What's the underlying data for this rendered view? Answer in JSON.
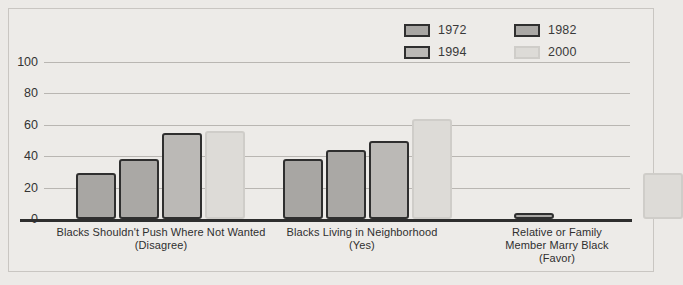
{
  "chart_data": {
    "type": "bar",
    "title": "",
    "subtitle": "",
    "xlabel": "",
    "ylabel": "",
    "ylim": [
      0,
      100
    ],
    "yticks": [
      0,
      20,
      40,
      60,
      80,
      100
    ],
    "ytick_labels": [
      "0",
      "20",
      "40",
      "60",
      "80",
      "100"
    ],
    "grid": true,
    "legend_position": "top-right",
    "categories": [
      "Blacks Shouldn't Push Where Not Wanted (Disagree)",
      "Blacks Living in Neighborhood (Yes)",
      "Relative or Family Member Marry Black (Favor)"
    ],
    "category_lines": [
      [
        "Blacks Shouldn't Push Where Not Wanted",
        "(Disagree)"
      ],
      [
        "Blacks Living in Neighborhood",
        "(Yes)"
      ],
      [
        "Relative or Family",
        "Member Marry Black",
        "(Favor)"
      ]
    ],
    "series": [
      {
        "name": "1972",
        "color": "#a8a6a3",
        "values": [
          29,
          38,
          4
        ]
      },
      {
        "name": "1982",
        "color": "#aaa8a5",
        "values": [
          38,
          44,
          null
        ]
      },
      {
        "name": "1994",
        "color": "#bbb9b6",
        "values": [
          55,
          50,
          null
        ]
      },
      {
        "name": "2000",
        "color": "#dddbd7",
        "values": [
          56,
          64,
          29
        ]
      }
    ]
  },
  "legend": {
    "entries": [
      {
        "label": "1972",
        "color": "#a8a6a3",
        "outline": "dark"
      },
      {
        "label": "1982",
        "color": "#aaa8a5",
        "outline": "dark"
      },
      {
        "label": "1994",
        "color": "#bbb9b6",
        "outline": "dark"
      },
      {
        "label": "2000",
        "color": "#dddbd7",
        "outline": "light"
      }
    ]
  },
  "colors": {
    "background": "#eceae7",
    "frame": "#c9c6c2",
    "gridline": "#b9b6b2",
    "baseline": "#2e2e2e",
    "text": "#2f2f2f",
    "outline_dark": "#2f2f2f",
    "outline_light": "#cfcdc9"
  }
}
